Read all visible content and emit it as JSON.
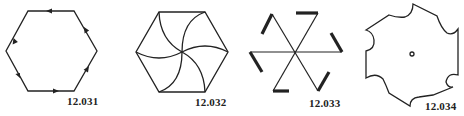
{
  "figures": [
    {
      "id": "fig1",
      "label": "12.031",
      "description": "Hexagon with directed edges (arrows circulating around the perimeter)"
    },
    {
      "id": "fig2",
      "label": "12.032",
      "description": "Hexagon divided by six curved arcs from vertices to the center (pinwheel)"
    },
    {
      "id": "fig3",
      "label": "12.033",
      "description": "Three lines crossing at center, each end with a thick bent hook (pinwheel star)"
    },
    {
      "id": "fig4",
      "label": "12.034",
      "description": "Gear-like polygon with concave scalloped edges and a small circle at center"
    }
  ],
  "colors": {
    "stroke": "#222222",
    "background": "#ffffff"
  }
}
